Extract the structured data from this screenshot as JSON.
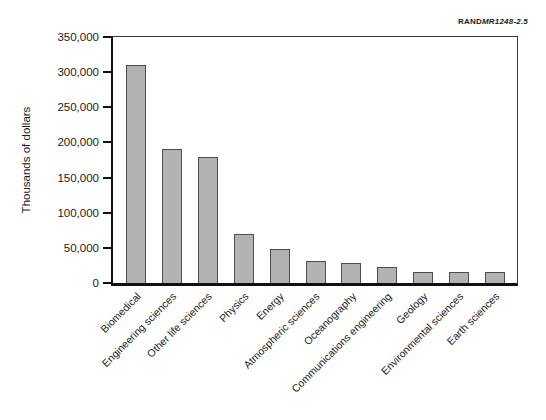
{
  "figure_label": {
    "brand": "RAND",
    "doc_id": "MR1248-2.5"
  },
  "chart_data": {
    "type": "bar",
    "title": "",
    "xlabel": "",
    "ylabel": "Thousands of dollars",
    "categories": [
      "Biomedical",
      "Engineering sciences",
      "Other life sciences",
      "Physics",
      "Energy",
      "Atmospheric sciences",
      "Oceanography",
      "Communications engineering",
      "Geology",
      "Environmental sciences",
      "Earth sciences"
    ],
    "values": [
      310000,
      190000,
      180000,
      70000,
      48000,
      31000,
      28000,
      23000,
      16000,
      15000,
      15000
    ],
    "ylim": [
      0,
      350000
    ],
    "ytick_step": 50000,
    "ytick_labels": [
      "0",
      "50,000",
      "100,000",
      "150,000",
      "200,000",
      "250,000",
      "300,000",
      "350,000"
    ],
    "grid": false,
    "legend": "none",
    "bar_color": "#b2b2b2",
    "bar_border_color": "#4d4d4d",
    "axis_color": "#111111",
    "text_color": "#1a1a1a"
  }
}
